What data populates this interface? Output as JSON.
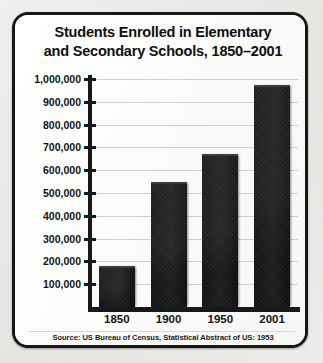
{
  "card": {
    "title_line1": "Students Enrolled in Elementary",
    "title_line2": "and Secondary Schools, 1850–2001",
    "source": "Source: US Bureau of Census, Statistical Abstract of US: 1953"
  },
  "colors": {
    "bar": "#121315",
    "frame": "#16181a",
    "grid": "#cfcfcf",
    "panel": "#fdfdfc",
    "page": "#edecea",
    "text": "#0d0f11"
  },
  "chart_data": {
    "type": "bar",
    "title": "Students Enrolled in Elementary and Secondary Schools, 1850–2001",
    "xlabel": "",
    "ylabel": "",
    "categories": [
      "1850",
      "1900",
      "1950",
      "2001"
    ],
    "values": [
      180000,
      550000,
      670000,
      975000
    ],
    "ylim": [
      0,
      1000000
    ],
    "ytick_values": [
      100000,
      200000,
      300000,
      400000,
      500000,
      600000,
      700000,
      800000,
      900000,
      1000000
    ],
    "ytick_labels": [
      "100,000",
      "200,000",
      "300,000",
      "400,000",
      "500,000",
      "600,000",
      "700,000",
      "800,000",
      "900,000",
      "1,000,000"
    ],
    "grid": true,
    "legend": false,
    "source_note": "Source: US Bureau of Census, Statistical Abstract of US: 1953"
  }
}
